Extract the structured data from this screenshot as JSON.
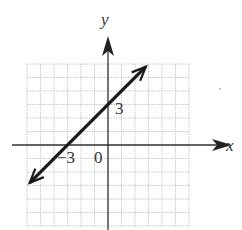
{
  "chart_data": {
    "type": "line",
    "title": "",
    "xlabel": "x",
    "ylabel": "y",
    "xlim": [
      -6,
      6
    ],
    "ylim": [
      -6,
      6
    ],
    "grid": true,
    "grid_step": 1,
    "legend": null,
    "series": [
      {
        "name": "y = x + 3",
        "equation": "y = x + 3",
        "slope": 1,
        "intercept": 3,
        "x": [
          -5.8,
          -3,
          0,
          2.8
        ],
        "y": [
          -2.8,
          0,
          3,
          5.8
        ],
        "arrows_both_ends": true
      }
    ],
    "annotations": [
      {
        "text": "3",
        "at": [
          0,
          3
        ],
        "meaning": "y-intercept"
      },
      {
        "text": "−3",
        "at": [
          -3,
          0
        ],
        "meaning": "x-intercept"
      },
      {
        "text": "0",
        "at": [
          0,
          0
        ],
        "meaning": "origin"
      }
    ]
  },
  "labels": {
    "x_axis": "x",
    "y_axis": "y",
    "y_intercept": "3",
    "x_intercept": "−3",
    "origin": "0"
  },
  "colors": {
    "line": "#1a1a1a",
    "axis": "#333333",
    "grid": "#b0b0b0",
    "background": "#ffffff"
  }
}
